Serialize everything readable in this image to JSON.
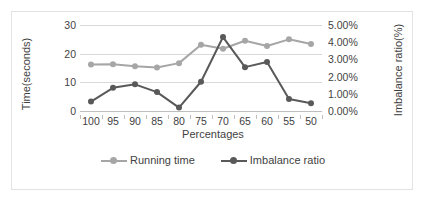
{
  "chart_data": {
    "type": "line",
    "title": "",
    "xlabel": "Percentages",
    "ylabel": "Time(seconds)",
    "y2label": "Imbalance ratio(%)",
    "categories": [
      "100",
      "95",
      "90",
      "85",
      "80",
      "75",
      "70",
      "65",
      "60",
      "55",
      "50"
    ],
    "ylim": [
      0,
      30
    ],
    "yticks": [
      "0",
      "10",
      "20",
      "30"
    ],
    "ytick_values": [
      0,
      10,
      20,
      30
    ],
    "y2lim": [
      0,
      5
    ],
    "y2ticks": [
      "0.00%",
      "1.00%",
      "2.00%",
      "3.00%",
      "4.00%",
      "5.00%"
    ],
    "y2tick_values": [
      0,
      1,
      2,
      3,
      4,
      5
    ],
    "grid": true,
    "legend_position": "bottom",
    "series": [
      {
        "name": "Running time",
        "axis": "left",
        "color": "#a6a6a6",
        "values": [
          16.2,
          16.3,
          15.6,
          15.2,
          16.7,
          23.1,
          21.7,
          24.5,
          22.7,
          25.0,
          23.4
        ]
      },
      {
        "name": "Imbalance ratio",
        "axis": "right",
        "color": "#595959",
        "values": [
          0.55,
          1.35,
          1.55,
          1.1,
          0.2,
          1.7,
          4.3,
          2.55,
          2.85,
          0.7,
          0.45
        ]
      }
    ]
  },
  "axes": {
    "x_title": "Percentages",
    "y_left_title": "Time(seconds)",
    "y_right_title": "Imbalance ratio(%)"
  },
  "legend": {
    "items": [
      {
        "label": "Running time",
        "color": "#a6a6a6"
      },
      {
        "label": "Imbalance ratio",
        "color": "#595959"
      }
    ]
  },
  "colors": {
    "running_time": "#a6a6a6",
    "imbalance_ratio": "#595959",
    "gridline": "#d9d9d9",
    "border": "#e3e3e3",
    "text": "#3f3f3f"
  }
}
